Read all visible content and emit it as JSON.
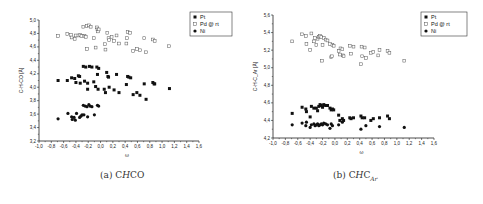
{
  "chart_data": [
    {
      "type": "scatter",
      "panel": "a",
      "caption": "(a) CHCO",
      "caption_parts": {
        "prefix": "(a) C",
        "italic": "H",
        "suffix": "CO",
        "subscript": ""
      },
      "xlabel": "ω",
      "ylabel": "C-H-CO [Å]",
      "xlim": [
        -1.0,
        1.6
      ],
      "ylim": [
        3.2,
        5.0
      ],
      "xticks": [
        "-1,0",
        "-0,8",
        "-0,6",
        "-0,4",
        "-0,2",
        "0,0",
        "0,2",
        "0,4",
        "0,6",
        "0,8",
        "1,0",
        "1,2",
        "1,4",
        "1,6"
      ],
      "yticks": [
        "3,2",
        "3,4",
        "3,6",
        "3,8",
        "4,0",
        "4,2",
        "4,4",
        "4,6",
        "4,8",
        "5,0"
      ],
      "grid": false,
      "legend_position": "top-right",
      "legend": [
        "Pt",
        "Pd @ rt",
        "Ni"
      ],
      "series": [
        {
          "name": "Pd @ rt",
          "marker": "open-square",
          "points": [
            [
              -0.69,
              4.76
            ],
            [
              -0.54,
              4.79
            ],
            [
              -0.48,
              4.78
            ],
            [
              -0.47,
              4.74
            ],
            [
              -0.42,
              4.72
            ],
            [
              -0.4,
              4.77
            ],
            [
              -0.36,
              4.77
            ],
            [
              -0.33,
              4.78
            ],
            [
              -0.31,
              4.76
            ],
            [
              -0.28,
              4.9
            ],
            [
              -0.26,
              4.76
            ],
            [
              -0.24,
              4.75
            ],
            [
              -0.22,
              4.91
            ],
            [
              -0.22,
              4.57
            ],
            [
              -0.19,
              4.92
            ],
            [
              -0.16,
              4.9
            ],
            [
              -0.11,
              4.73
            ],
            [
              -0.08,
              4.59
            ],
            [
              -0.06,
              4.89
            ],
            [
              -0.05,
              4.86
            ],
            [
              -0.04,
              4.83
            ],
            [
              -0.03,
              4.86
            ],
            [
              0.07,
              4.64
            ],
            [
              0.08,
              4.56
            ],
            [
              0.11,
              4.81
            ],
            [
              0.13,
              4.73
            ],
            [
              0.14,
              4.7
            ],
            [
              0.18,
              4.75
            ],
            [
              0.22,
              4.69
            ],
            [
              0.26,
              4.77
            ],
            [
              0.3,
              4.65
            ],
            [
              0.42,
              4.65
            ],
            [
              0.43,
              4.73
            ],
            [
              0.44,
              4.82
            ],
            [
              0.48,
              4.81
            ],
            [
              0.53,
              4.54
            ],
            [
              0.59,
              4.57
            ],
            [
              0.64,
              4.55
            ],
            [
              0.71,
              4.73
            ],
            [
              0.74,
              4.52
            ],
            [
              0.85,
              4.71
            ],
            [
              0.88,
              4.69
            ],
            [
              1.11,
              4.61
            ]
          ]
        },
        {
          "name": "Pt",
          "marker": "filled-square",
          "points": [
            [
              -0.69,
              4.1
            ],
            [
              -0.54,
              4.1
            ],
            [
              -0.47,
              4.14
            ],
            [
              -0.42,
              4.13
            ],
            [
              -0.4,
              4.07
            ],
            [
              -0.36,
              4.17
            ],
            [
              -0.34,
              4.16
            ],
            [
              -0.33,
              4.06
            ],
            [
              -0.28,
              4.31
            ],
            [
              -0.26,
              4.09
            ],
            [
              -0.24,
              4.3
            ],
            [
              -0.21,
              4.06
            ],
            [
              -0.21,
              3.97
            ],
            [
              -0.18,
              4.31
            ],
            [
              -0.14,
              4.3
            ],
            [
              -0.11,
              4.08
            ],
            [
              -0.08,
              4.01
            ],
            [
              -0.06,
              4.3
            ],
            [
              -0.05,
              4.19
            ],
            [
              -0.04,
              3.97
            ],
            [
              -0.03,
              4.28
            ],
            [
              0.06,
              3.97
            ],
            [
              0.08,
              3.92
            ],
            [
              0.1,
              4.22
            ],
            [
              0.12,
              4.16
            ],
            [
              0.13,
              4.15
            ],
            [
              0.14,
              4.0
            ],
            [
              0.22,
              3.96
            ],
            [
              0.26,
              4.19
            ],
            [
              0.3,
              3.92
            ],
            [
              0.42,
              4.04
            ],
            [
              0.44,
              4.16
            ],
            [
              0.46,
              4.15
            ],
            [
              0.49,
              4.14
            ],
            [
              0.53,
              3.89
            ],
            [
              0.59,
              3.92
            ],
            [
              0.64,
              3.88
            ],
            [
              0.71,
              4.05
            ],
            [
              0.74,
              3.82
            ],
            [
              0.85,
              4.07
            ],
            [
              0.87,
              4.05
            ],
            [
              0.88,
              4.05
            ],
            [
              1.12,
              3.98
            ]
          ]
        },
        {
          "name": "Ni",
          "marker": "filled-circle",
          "points": [
            [
              -0.69,
              3.53
            ],
            [
              -0.53,
              3.61
            ],
            [
              -0.47,
              3.56
            ],
            [
              -0.46,
              3.52
            ],
            [
              -0.43,
              3.55
            ],
            [
              -0.41,
              3.51
            ],
            [
              -0.39,
              3.61
            ],
            [
              -0.34,
              3.55
            ],
            [
              -0.32,
              3.57
            ],
            [
              -0.3,
              3.59
            ],
            [
              -0.28,
              3.73
            ],
            [
              -0.27,
              3.59
            ],
            [
              -0.25,
              3.72
            ],
            [
              -0.22,
              3.71
            ],
            [
              -0.21,
              3.56
            ],
            [
              -0.19,
              3.74
            ],
            [
              -0.17,
              3.72
            ],
            [
              -0.14,
              3.71
            ],
            [
              -0.1,
              3.59
            ],
            [
              -0.05,
              3.73
            ],
            [
              -0.03,
              3.72
            ]
          ]
        }
      ]
    },
    {
      "type": "scatter",
      "panel": "b",
      "caption": "(b) CHC_Ar",
      "caption_parts": {
        "prefix": "(b) C",
        "italic": "H",
        "suffix": "C",
        "subscript": "Ar"
      },
      "xlabel": "ω",
      "ylabel": "C-H-C_Ar [Å]",
      "xlim": [
        -1.0,
        1.6
      ],
      "ylim": [
        4.2,
        5.6
      ],
      "xticks": [
        "-1,0",
        "-0,8",
        "-0,6",
        "-0,4",
        "-0,2",
        "0,0",
        "0,2",
        "0,4",
        "0,6",
        "0,8",
        "1,0",
        "1,2",
        "1,4",
        "1,6"
      ],
      "yticks": [
        "4,2",
        "4,4",
        "4,6",
        "4,8",
        "5,0",
        "5,2",
        "5,4",
        "5,6"
      ],
      "grid": false,
      "legend_position": "top-right",
      "legend": [
        "Pt",
        "Pd @ rt",
        "Ni"
      ],
      "series": [
        {
          "name": "Pd @ rt",
          "marker": "open-square",
          "points": [
            [
              -0.69,
              5.3
            ],
            [
              -0.53,
              5.38
            ],
            [
              -0.47,
              5.36
            ],
            [
              -0.46,
              5.27
            ],
            [
              -0.4,
              5.2
            ],
            [
              -0.38,
              5.39
            ],
            [
              -0.34,
              5.3
            ],
            [
              -0.32,
              5.34
            ],
            [
              -0.3,
              5.26
            ],
            [
              -0.28,
              5.33
            ],
            [
              -0.26,
              5.35
            ],
            [
              -0.24,
              5.36
            ],
            [
              -0.22,
              5.35
            ],
            [
              -0.21,
              5.08
            ],
            [
              -0.2,
              5.26
            ],
            [
              -0.18,
              5.34
            ],
            [
              -0.15,
              5.32
            ],
            [
              -0.12,
              5.31
            ],
            [
              -0.08,
              5.27
            ],
            [
              -0.06,
              5.12
            ],
            [
              -0.05,
              5.13
            ],
            [
              -0.04,
              5.26
            ],
            [
              -0.02,
              5.25
            ],
            [
              0.06,
              5.19
            ],
            [
              0.08,
              5.15
            ],
            [
              0.09,
              5.22
            ],
            [
              0.12,
              5.21
            ],
            [
              0.13,
              5.14
            ],
            [
              0.14,
              5.13
            ],
            [
              0.24,
              5.25
            ],
            [
              0.26,
              5.16
            ],
            [
              0.3,
              5.24
            ],
            [
              0.42,
              5.04
            ],
            [
              0.43,
              5.24
            ],
            [
              0.44,
              5.13
            ],
            [
              0.48,
              5.23
            ],
            [
              0.5,
              5.11
            ],
            [
              0.58,
              5.17
            ],
            [
              0.62,
              5.18
            ],
            [
              0.7,
              5.14
            ],
            [
              0.72,
              5.2
            ],
            [
              0.85,
              5.19
            ],
            [
              0.88,
              5.17
            ],
            [
              1.12,
              5.08
            ]
          ]
        },
        {
          "name": "Pt",
          "marker": "filled-square",
          "points": [
            [
              -0.69,
              4.48
            ],
            [
              -0.53,
              4.55
            ],
            [
              -0.47,
              4.53
            ],
            [
              -0.46,
              4.5
            ],
            [
              -0.4,
              4.44
            ],
            [
              -0.38,
              4.56
            ],
            [
              -0.34,
              4.54
            ],
            [
              -0.3,
              4.54
            ],
            [
              -0.28,
              4.51
            ],
            [
              -0.26,
              4.56
            ],
            [
              -0.24,
              4.58
            ],
            [
              -0.22,
              4.57
            ],
            [
              -0.2,
              4.55
            ],
            [
              -0.18,
              4.58
            ],
            [
              -0.15,
              4.57
            ],
            [
              -0.12,
              4.57
            ],
            [
              -0.08,
              4.54
            ],
            [
              -0.06,
              4.52
            ],
            [
              -0.04,
              4.53
            ],
            [
              -0.02,
              4.52
            ],
            [
              0.06,
              4.46
            ],
            [
              0.08,
              4.4
            ],
            [
              0.12,
              4.42
            ],
            [
              0.14,
              4.4
            ],
            [
              0.24,
              4.43
            ],
            [
              0.26,
              4.42
            ],
            [
              0.3,
              4.43
            ],
            [
              0.42,
              4.45
            ],
            [
              0.44,
              4.43
            ],
            [
              0.48,
              4.43
            ],
            [
              0.58,
              4.4
            ],
            [
              0.62,
              4.42
            ],
            [
              0.72,
              4.43
            ],
            [
              0.85,
              4.45
            ],
            [
              0.88,
              4.42
            ]
          ]
        },
        {
          "name": "Ni",
          "marker": "filled-circle",
          "points": [
            [
              -0.69,
              4.35
            ],
            [
              -0.53,
              4.37
            ],
            [
              -0.47,
              4.34
            ],
            [
              -0.46,
              4.38
            ],
            [
              -0.4,
              4.32
            ],
            [
              -0.38,
              4.35
            ],
            [
              -0.34,
              4.36
            ],
            [
              -0.32,
              4.34
            ],
            [
              -0.3,
              4.35
            ],
            [
              -0.28,
              4.36
            ],
            [
              -0.26,
              4.34
            ],
            [
              -0.24,
              4.35
            ],
            [
              -0.22,
              4.36
            ],
            [
              -0.2,
              4.35
            ],
            [
              -0.18,
              4.37
            ],
            [
              -0.15,
              4.36
            ],
            [
              -0.12,
              4.35
            ],
            [
              -0.08,
              4.31
            ],
            [
              -0.06,
              4.36
            ],
            [
              -0.04,
              4.34
            ],
            [
              0.06,
              4.35
            ],
            [
              0.12,
              4.38
            ],
            [
              0.42,
              4.3
            ],
            [
              0.5,
              4.34
            ],
            [
              0.72,
              4.33
            ],
            [
              1.12,
              4.32
            ]
          ]
        }
      ]
    }
  ]
}
